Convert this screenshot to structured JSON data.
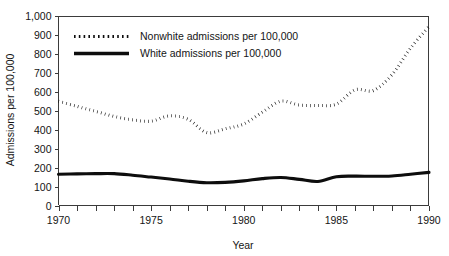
{
  "chart_data": {
    "type": "line",
    "title": "",
    "subtitle": "",
    "xlabel": "Year",
    "ylabel": "Admissions per 100,000",
    "xlim": [
      1970,
      1990
    ],
    "ylim": [
      0,
      1000
    ],
    "grid": false,
    "legend_position": "top-left",
    "x": [
      1970,
      1971,
      1972,
      1973,
      1974,
      1975,
      1976,
      1977,
      1978,
      1979,
      1980,
      1981,
      1982,
      1983,
      1984,
      1985,
      1986,
      1987,
      1988,
      1989,
      1990
    ],
    "y_ticks": [
      0,
      100,
      200,
      300,
      400,
      500,
      600,
      700,
      800,
      900,
      1000
    ],
    "y_tick_labels": [
      "0",
      "100",
      "200",
      "300",
      "400",
      "500",
      "600",
      "700",
      "800",
      "900",
      "1,000"
    ],
    "x_ticks": [
      1970,
      1971,
      1972,
      1973,
      1974,
      1975,
      1976,
      1977,
      1978,
      1979,
      1980,
      1981,
      1982,
      1983,
      1984,
      1985,
      1986,
      1987,
      1988,
      1989,
      1990
    ],
    "x_tick_labels_shown": [
      "1970",
      "1975",
      "1980",
      "1985",
      "1990"
    ],
    "x_labeled_values": [
      1970,
      1975,
      1980,
      1985,
      1990
    ],
    "series": [
      {
        "name": "Nonwhite admissions per 100,000",
        "style": "dotted",
        "color": "#0d0d0d",
        "values": [
          550,
          523,
          497,
          470,
          452,
          445,
          473,
          455,
          385,
          405,
          430,
          492,
          550,
          530,
          528,
          535,
          610,
          607,
          690,
          830,
          945
        ]
      },
      {
        "name": "White admissions per 100,000",
        "style": "solid",
        "color": "#0d0d0d",
        "values": [
          165,
          167,
          168,
          168,
          160,
          150,
          140,
          128,
          120,
          122,
          130,
          142,
          148,
          138,
          127,
          152,
          155,
          154,
          156,
          165,
          175
        ]
      }
    ]
  },
  "legend": {
    "entries": [
      {
        "label": "Nonwhite admissions per 100,000",
        "marker": "dotted-line-swatch"
      },
      {
        "label": "White admissions per 100,000",
        "marker": "solid-line-swatch"
      }
    ]
  },
  "axes": {
    "y_title": "Admissions per 100,000",
    "x_title": "Year"
  },
  "colors": {
    "background": "#ffffff",
    "ink": "#0d0d0d",
    "axis": "#3b3b3b"
  }
}
